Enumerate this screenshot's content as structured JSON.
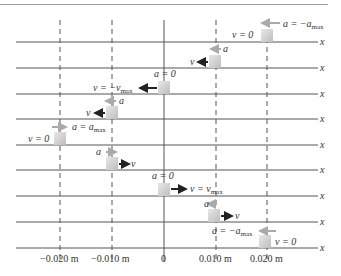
{
  "axis_label": "x",
  "positions": [
    "-0.020 m",
    "-0.010 m",
    "0",
    "0.010 m",
    "0.020 m"
  ],
  "rows": [
    {
      "x": 0.02,
      "v": "v = 0",
      "a": "a = -a_max",
      "v_dir": "none",
      "a_dir": "left"
    },
    {
      "x": 0.01,
      "v": "v",
      "a": "a",
      "v_dir": "left",
      "a_dir": "left"
    },
    {
      "x": 0,
      "v": "v = -v_max",
      "a": "a = 0",
      "v_dir": "left",
      "a_dir": "none"
    },
    {
      "x": -0.01,
      "v": "v",
      "a": "a",
      "v_dir": "left",
      "a_dir": "right"
    },
    {
      "x": -0.02,
      "v": "v = 0",
      "a": "a = a_max",
      "v_dir": "none",
      "a_dir": "right"
    },
    {
      "x": -0.01,
      "v": "v",
      "a": "a",
      "v_dir": "right",
      "a_dir": "right"
    },
    {
      "x": 0,
      "v": "v = v_max",
      "a": "a = 0",
      "v_dir": "right",
      "a_dir": "none"
    },
    {
      "x": 0.01,
      "v": "v",
      "a": "a",
      "v_dir": "right",
      "a_dir": "left"
    },
    {
      "x": 0.02,
      "v": "v = 0",
      "a": "a = -a_max",
      "v_dir": "none",
      "a_dir": "left"
    }
  ],
  "colors": {
    "axis": "#555555",
    "block": "#cfcfcf",
    "v_arrow": "#222222",
    "a_arrow": "#aaaaaa"
  }
}
